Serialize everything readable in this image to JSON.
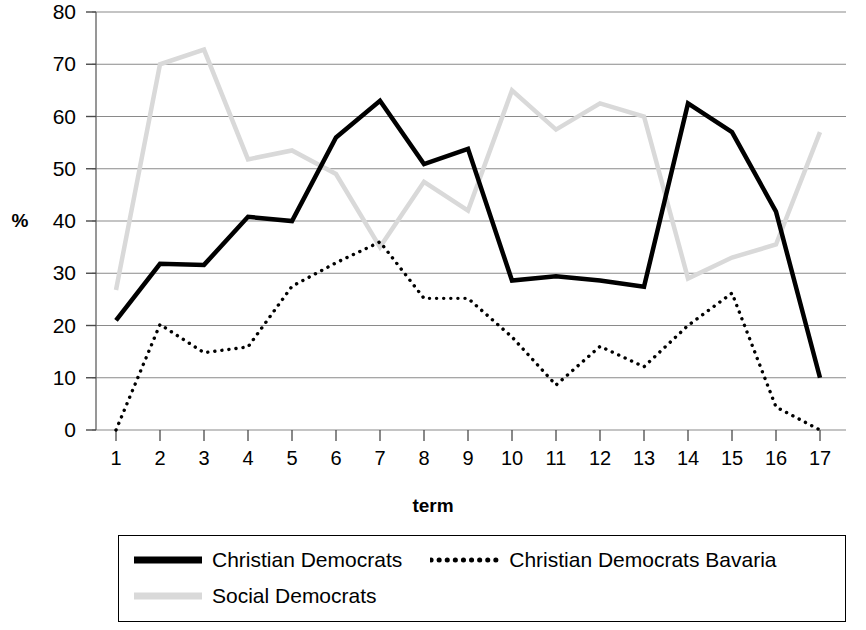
{
  "chart_data": {
    "type": "line",
    "title": "",
    "xlabel": "term",
    "ylabel": "%",
    "x": [
      1,
      2,
      3,
      4,
      5,
      6,
      7,
      8,
      9,
      10,
      11,
      12,
      13,
      14,
      15,
      16,
      17
    ],
    "xtick_labels": [
      "1",
      "2",
      "3",
      "4",
      "5",
      "6",
      "7",
      "8",
      "9",
      "10",
      "11",
      "12",
      "13",
      "14",
      "15",
      "16",
      "17"
    ],
    "ytick_labels": [
      "80",
      "70",
      "60",
      "50",
      "40",
      "30",
      "20",
      "10",
      "0"
    ],
    "ytick_values": [
      80,
      70,
      60,
      50,
      40,
      30,
      20,
      10,
      0
    ],
    "ylim": [
      0,
      80
    ],
    "xlim": [
      1,
      17
    ],
    "grid": "horizontal",
    "legend_position": "bottom",
    "series": [
      {
        "name": "Christian Democrats",
        "color": "#000000",
        "style": "solid",
        "width": 4.5,
        "values": [
          21.0,
          31.8,
          31.6,
          40.8,
          40.0,
          56.0,
          63.0,
          50.9,
          53.8,
          28.6,
          29.4,
          28.6,
          27.4,
          62.5,
          57.0,
          41.8,
          10.0
        ]
      },
      {
        "name": "Christian Democrats Bavaria",
        "color": "#000000",
        "style": "dotted",
        "width": 3.4,
        "values": [
          0.0,
          20.2,
          14.8,
          15.9,
          27.5,
          32.0,
          36.0,
          25.2,
          25.2,
          17.8,
          8.6,
          16.0,
          12.1,
          20.0,
          26.2,
          4.4,
          0.0
        ]
      },
      {
        "name": "Social Democrats",
        "color": "#d9d9d9",
        "style": "solid",
        "width": 4.5,
        "values": [
          26.8,
          70.0,
          72.8,
          51.8,
          53.5,
          49.0,
          35.0,
          47.5,
          42.0,
          65.0,
          57.5,
          62.5,
          60.0,
          29.0,
          33.0,
          35.5,
          57.0
        ]
      }
    ]
  },
  "legend": {
    "items": [
      {
        "label": "Christian Democrats",
        "swatch": "solid-black-line"
      },
      {
        "label": "Christian Democrats Bavaria",
        "swatch": "dotted-black-line"
      },
      {
        "label": "Social Democrats",
        "swatch": "solid-gray-line"
      }
    ]
  }
}
